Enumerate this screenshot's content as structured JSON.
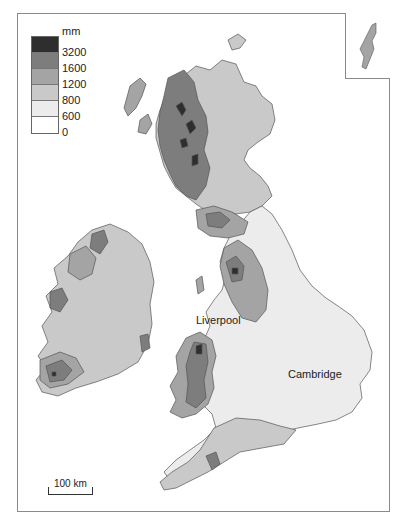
{
  "map": {
    "subject": "Average annual rainfall, British Isles",
    "legend": {
      "unit": "mm",
      "classes": [
        {
          "label": "3200",
          "range": ">3200",
          "color": "#2e2e2e"
        },
        {
          "label": "1600",
          "range": "1600-3200",
          "color": "#7d7d7d"
        },
        {
          "label": "1200",
          "range": "1200-1600",
          "color": "#a4a4a4"
        },
        {
          "label": "800",
          "range": "800-1200",
          "color": "#c9c9c9"
        },
        {
          "label": "600",
          "range": "600-800",
          "color": "#ececec"
        },
        {
          "label": "0",
          "range": "0-600",
          "color": "#ffffff"
        }
      ],
      "boundary_labels": [
        "3200",
        "1600",
        "1200",
        "800",
        "600",
        "0"
      ]
    },
    "places": [
      {
        "name": "Liverpool"
      },
      {
        "name": "Cambridge"
      }
    ],
    "scale_bar": {
      "label": "100 km"
    },
    "inset": {
      "name": "Shetland Islands"
    }
  }
}
